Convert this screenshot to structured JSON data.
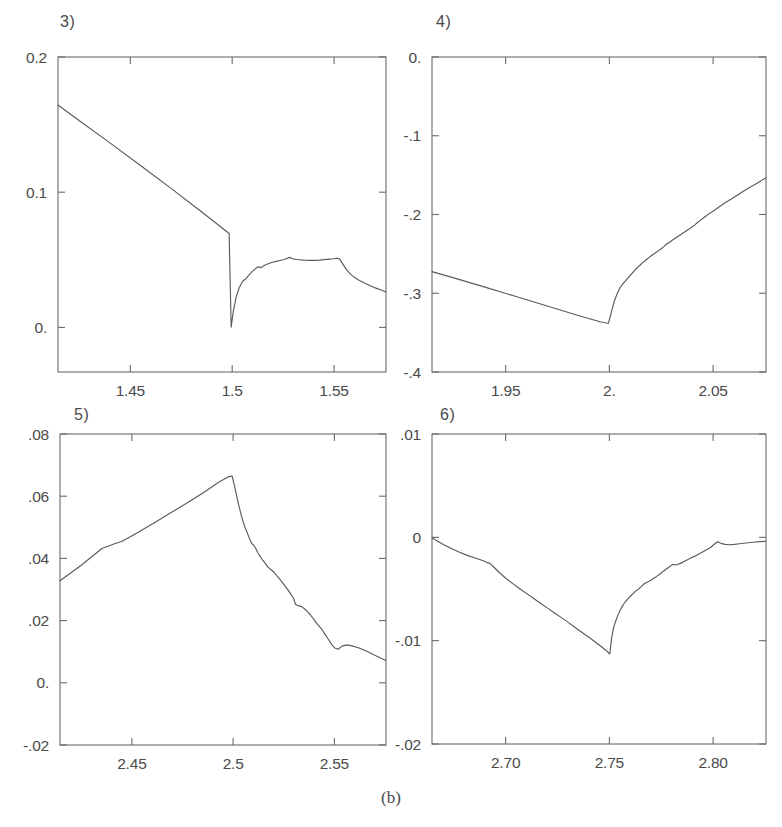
{
  "figure": {
    "caption": "(b)",
    "panels": [
      {
        "number": "3)",
        "y_ticks": [
          "0.2",
          "0.1",
          "0."
        ],
        "y_tick_values": [
          0.2,
          0.1,
          0.0
        ],
        "x_ticks": [
          "1.45",
          "1.5",
          "1.55"
        ],
        "x_tick_values": [
          1.45,
          1.5,
          1.55
        ]
      },
      {
        "number": "4)",
        "y_ticks": [
          "0.",
          "-.1",
          "-.2",
          "-.3",
          "-.4"
        ],
        "y_tick_values": [
          0.0,
          -0.1,
          -0.2,
          -0.3,
          -0.4
        ],
        "x_ticks": [
          "1.95",
          "2.",
          "2.05"
        ],
        "x_tick_values": [
          1.95,
          2.0,
          2.05
        ]
      },
      {
        "number": "5)",
        "y_ticks": [
          ".08",
          ".06",
          ".04",
          ".02",
          "0.",
          "-.02"
        ],
        "y_tick_values": [
          0.08,
          0.06,
          0.04,
          0.02,
          0.0,
          -0.02
        ],
        "x_ticks": [
          "2.45",
          "2.5",
          "2.55"
        ],
        "x_tick_values": [
          2.45,
          2.5,
          2.55
        ]
      },
      {
        "number": "6)",
        "y_ticks": [
          ".01",
          "0",
          "-.01",
          "-.02"
        ],
        "y_tick_values": [
          0.01,
          0.0,
          -0.01,
          -0.02
        ],
        "x_ticks": [
          "2.70",
          "2.75",
          "2.80"
        ],
        "x_tick_values": [
          2.7,
          2.75,
          2.8
        ]
      }
    ]
  },
  "chart_data": [
    {
      "type": "line",
      "title": "3)",
      "xlabel": "",
      "ylabel": "",
      "xlim": [
        1.4145,
        1.5755
      ],
      "ylim": [
        -0.033,
        0.2
      ],
      "grid": false,
      "legend": "none",
      "series": [
        {
          "name": "curve-3",
          "x": [
            1.4145,
            1.425,
            1.44,
            1.455,
            1.47,
            1.483,
            1.492,
            1.4985,
            1.4995,
            1.5005,
            1.502,
            1.5035,
            1.5048,
            1.5055,
            1.5062,
            1.5072,
            1.5085,
            1.5098,
            1.5105,
            1.5115,
            1.5128,
            1.514,
            1.5152,
            1.5162,
            1.518,
            1.5198,
            1.5215,
            1.5235,
            1.5255,
            1.5272,
            1.5285,
            1.5295,
            1.5305,
            1.532,
            1.5338,
            1.5358,
            1.5382,
            1.5405,
            1.5428,
            1.5452,
            1.5478,
            1.5498,
            1.5515,
            1.5528,
            1.554,
            1.5552,
            1.5562,
            1.5572,
            1.5582,
            1.5598,
            1.5618,
            1.5645,
            1.5672,
            1.5702,
            1.5728,
            1.5755
          ],
          "y": [
            0.1645,
            0.1528,
            0.1365,
            0.1198,
            0.1028,
            0.0878,
            0.0772,
            0.0695,
            0.0002,
            0.0115,
            0.0228,
            0.0295,
            0.0332,
            0.0348,
            0.0352,
            0.0368,
            0.0392,
            0.0412,
            0.0422,
            0.0435,
            0.0448,
            0.0442,
            0.0452,
            0.0462,
            0.0472,
            0.0482,
            0.0488,
            0.0495,
            0.0502,
            0.0512,
            0.0518,
            0.0508,
            0.0505,
            0.0502,
            0.0499,
            0.0497,
            0.0496,
            0.0496,
            0.0498,
            0.0501,
            0.0505,
            0.0508,
            0.0512,
            0.0505,
            0.0475,
            0.0448,
            0.0425,
            0.0408,
            0.0392,
            0.0372,
            0.0352,
            0.0332,
            0.0312,
            0.0292,
            0.0278,
            0.0262
          ]
        }
      ]
    },
    {
      "type": "line",
      "title": "4)",
      "xlabel": "",
      "ylabel": "",
      "xlim": [
        1.9145,
        2.0755
      ],
      "ylim": [
        -0.4,
        0.0
      ],
      "grid": false,
      "legend": "none",
      "series": [
        {
          "name": "curve-4",
          "x": [
            1.9145,
            1.925,
            1.94,
            1.955,
            1.97,
            1.985,
            1.9955,
            1.9985,
            1.9995,
            2.0005,
            2.0015,
            2.0025,
            2.0035,
            2.0045,
            2.0052,
            2.006,
            2.0068,
            2.0078,
            2.0088,
            2.0098,
            2.0108,
            2.0118,
            2.0128,
            2.014,
            2.0152,
            2.0162,
            2.0168,
            2.0178,
            2.019,
            2.0205,
            2.022,
            2.0235,
            2.0248,
            2.0258,
            2.0265,
            2.0275,
            2.029,
            2.0308,
            2.0328,
            2.0348,
            2.0368,
            2.0388,
            2.0402,
            2.0412,
            2.0422,
            2.0438,
            2.0458,
            2.048,
            2.0505,
            2.053,
            2.0558,
            2.0588,
            2.0618,
            2.0648,
            2.0678,
            2.0712,
            2.0755
          ],
          "y": [
            -0.2725,
            -0.2805,
            -0.2922,
            -0.3042,
            -0.3162,
            -0.3282,
            -0.3362,
            -0.3378,
            -0.3382,
            -0.3288,
            -0.3182,
            -0.3092,
            -0.3022,
            -0.2962,
            -0.2928,
            -0.2898,
            -0.2872,
            -0.2842,
            -0.2812,
            -0.2782,
            -0.2752,
            -0.2722,
            -0.2692,
            -0.2662,
            -0.2632,
            -0.2608,
            -0.2598,
            -0.2575,
            -0.2548,
            -0.2518,
            -0.2492,
            -0.2462,
            -0.2438,
            -0.2418,
            -0.2402,
            -0.2378,
            -0.2352,
            -0.2318,
            -0.2282,
            -0.2248,
            -0.2212,
            -0.2178,
            -0.2152,
            -0.2132,
            -0.2108,
            -0.2075,
            -0.2035,
            -0.1992,
            -0.1948,
            -0.1902,
            -0.1852,
            -0.1802,
            -0.1752,
            -0.1702,
            -0.1655,
            -0.1602,
            -0.1532
          ]
        }
      ]
    },
    {
      "type": "line",
      "title": "5)",
      "xlabel": "",
      "ylabel": "",
      "xlim": [
        2.4145,
        2.5755
      ],
      "ylim": [
        -0.02,
        0.08
      ],
      "grid": false,
      "legend": "none",
      "series": [
        {
          "name": "curve-5",
          "x": [
            2.4145,
            2.425,
            2.4352,
            2.4418,
            2.4452,
            2.4525,
            2.4605,
            2.4688,
            2.4772,
            2.4855,
            2.4928,
            2.4975,
            2.4995,
            2.5005,
            2.5015,
            2.5025,
            2.5035,
            2.5045,
            2.5052,
            2.506,
            2.507,
            2.5082,
            2.5092,
            2.5102,
            2.5112,
            2.5122,
            2.5132,
            2.5142,
            2.5158,
            2.5172,
            2.5185,
            2.5198,
            2.5215,
            2.5232,
            2.5252,
            2.5272,
            2.5288,
            2.5298,
            2.5308,
            2.5322,
            2.5338,
            2.5352,
            2.5368,
            2.5382,
            2.5398,
            2.5412,
            2.5425,
            2.5438,
            2.5452,
            2.5462,
            2.5475,
            2.5488,
            2.5502,
            2.5518,
            2.5538,
            2.5562,
            2.5592,
            2.5622,
            2.5658,
            2.5702,
            2.5755
          ],
          "y": [
            0.0328,
            0.0378,
            0.0432,
            0.0448,
            0.0455,
            0.0482,
            0.0512,
            0.0545,
            0.0578,
            0.0612,
            0.0645,
            0.0662,
            0.0665,
            0.0638,
            0.0608,
            0.0578,
            0.0552,
            0.0528,
            0.0512,
            0.0498,
            0.0482,
            0.0462,
            0.0448,
            0.0442,
            0.0432,
            0.0418,
            0.0408,
            0.0398,
            0.0385,
            0.0372,
            0.0365,
            0.0358,
            0.0345,
            0.0332,
            0.0315,
            0.0298,
            0.0282,
            0.0272,
            0.0252,
            0.0248,
            0.0245,
            0.0238,
            0.0228,
            0.0218,
            0.0205,
            0.0192,
            0.0182,
            0.0172,
            0.0158,
            0.0148,
            0.0135,
            0.0122,
            0.0112,
            0.0108,
            0.0118,
            0.0122,
            0.0118,
            0.0112,
            0.0102,
            0.0088,
            0.0072
          ]
        }
      ]
    },
    {
      "type": "line",
      "title": "6)",
      "xlabel": "",
      "ylabel": "",
      "xlim": [
        2.6645,
        2.8255
      ],
      "ylim": [
        -0.02,
        0.01
      ],
      "grid": false,
      "legend": "none",
      "series": [
        {
          "name": "curve-6",
          "x": [
            2.6645,
            2.667,
            2.6702,
            2.6738,
            2.6775,
            2.6812,
            2.6845,
            2.6875,
            2.6898,
            2.6912,
            2.6925,
            2.6945,
            2.6972,
            2.7002,
            2.7035,
            2.7068,
            2.7102,
            2.7135,
            2.7168,
            2.7202,
            2.7238,
            2.7272,
            2.7305,
            2.7338,
            2.7372,
            2.7405,
            2.7438,
            2.7468,
            2.7492,
            2.7498,
            2.7502,
            2.7512,
            2.7522,
            2.7532,
            2.7542,
            2.7552,
            2.7562,
            2.7572,
            2.7582,
            2.7592,
            2.7602,
            2.7615,
            2.7628,
            2.7642,
            2.7655,
            2.7668,
            2.7682,
            2.7698,
            2.7712,
            2.7728,
            2.7745,
            2.7762,
            2.7778,
            2.7792,
            2.7805,
            2.7822,
            2.7842,
            2.7865,
            2.7888,
            2.7912,
            2.7938,
            2.7962,
            2.7988,
            2.8008,
            2.8022,
            2.8038,
            2.8058,
            2.8078,
            2.8102,
            2.8128,
            2.8158,
            2.8192,
            2.8228,
            2.8255
          ],
          "y": [
            -5e-05,
            -0.00035,
            -0.00072,
            -0.00108,
            -0.00142,
            -0.00172,
            -0.00195,
            -0.00215,
            -0.00232,
            -0.00245,
            -0.00252,
            -0.00292,
            -0.00345,
            -0.00398,
            -0.00448,
            -0.00498,
            -0.00545,
            -0.00592,
            -0.00638,
            -0.00685,
            -0.00735,
            -0.00782,
            -0.00828,
            -0.00878,
            -0.00925,
            -0.00972,
            -0.01022,
            -0.01068,
            -0.01108,
            -0.01122,
            -0.01128,
            -0.00955,
            -0.00862,
            -0.00802,
            -0.00748,
            -0.00705,
            -0.00668,
            -0.00638,
            -0.00612,
            -0.00588,
            -0.00568,
            -0.00542,
            -0.00518,
            -0.00498,
            -0.00475,
            -0.00448,
            -0.00435,
            -0.00418,
            -0.00398,
            -0.00378,
            -0.00352,
            -0.00325,
            -0.00302,
            -0.00282,
            -0.00262,
            -0.00268,
            -0.00252,
            -0.00228,
            -0.00205,
            -0.00182,
            -0.00155,
            -0.00128,
            -0.00098,
            -0.00062,
            -0.00042,
            -0.00058,
            -0.00068,
            -0.00072,
            -0.00068,
            -0.00062,
            -0.00055,
            -0.00048,
            -0.00042,
            -0.00038
          ]
        }
      ]
    }
  ]
}
